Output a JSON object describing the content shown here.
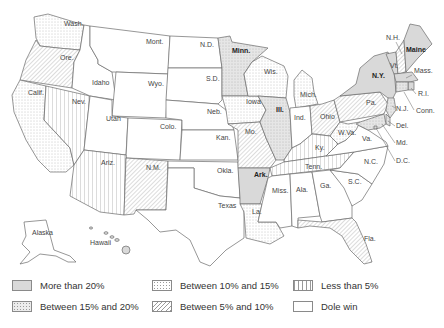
{
  "map": {
    "title": "",
    "categories": {
      "more_than_20": "More than 20%",
      "between_15_20": "Between 15% and 20%",
      "between_10_15": "Between 10% and 15%",
      "between_5_10": "Between 5% and 10%",
      "less_than_5": "Less than 5%",
      "dole_win": "Dole win"
    },
    "states": {
      "wash": {
        "label": "Wash.",
        "category": "between_10_15"
      },
      "ore": {
        "label": "Ore.",
        "category": "between_5_10"
      },
      "calif": {
        "label": "Calif.",
        "category": "between_10_15"
      },
      "nev": {
        "label": "Nev.",
        "category": "less_than_5"
      },
      "idaho": {
        "label": "Idaho",
        "category": "dole_win"
      },
      "mont": {
        "label": "Mont.",
        "category": "dole_win"
      },
      "wyo": {
        "label": "Wyo.",
        "category": "dole_win"
      },
      "utah": {
        "label": "Utah",
        "category": "dole_win"
      },
      "colo": {
        "label": "Colo.",
        "category": "dole_win"
      },
      "ariz": {
        "label": "Ariz.",
        "category": "less_than_5"
      },
      "nm": {
        "label": "N.M.",
        "category": "between_5_10"
      },
      "nd": {
        "label": "N.D.",
        "category": "dole_win"
      },
      "sd": {
        "label": "S.D.",
        "category": "dole_win"
      },
      "neb": {
        "label": "Neb.",
        "category": "dole_win"
      },
      "kan": {
        "label": "Kan.",
        "category": "dole_win"
      },
      "okla": {
        "label": "Okla.",
        "category": "dole_win"
      },
      "texas": {
        "label": "Texas",
        "category": "dole_win"
      },
      "minn": {
        "label": "Minn.",
        "category": "between_15_20"
      },
      "iowa": {
        "label": "Iowa",
        "category": "between_10_15"
      },
      "mo": {
        "label": "Mo.",
        "category": "between_5_10"
      },
      "ark": {
        "label": "Ark.",
        "category": "more_than_20"
      },
      "la": {
        "label": "La.",
        "category": "between_10_15"
      },
      "wis": {
        "label": "Wis.",
        "category": "between_10_15"
      },
      "ill": {
        "label": "Ill.",
        "category": "between_15_20"
      },
      "mich": {
        "label": "Mich.",
        "category": "between_10_15"
      },
      "ind": {
        "label": "Ind.",
        "category": "dole_win"
      },
      "ohio": {
        "label": "Ohio",
        "category": "between_5_10"
      },
      "ky": {
        "label": "Ky.",
        "category": "less_than_5"
      },
      "tenn": {
        "label": "Tenn.",
        "category": "less_than_5"
      },
      "miss": {
        "label": "Miss.",
        "category": "dole_win"
      },
      "ala": {
        "label": "Ala.",
        "category": "dole_win"
      },
      "ga": {
        "label": "Ga.",
        "category": "dole_win"
      },
      "fla": {
        "label": "Fla.",
        "category": "between_5_10"
      },
      "sc": {
        "label": "S.C.",
        "category": "dole_win"
      },
      "nc": {
        "label": "N.C.",
        "category": "dole_win"
      },
      "va": {
        "label": "Va.",
        "category": "dole_win"
      },
      "wva": {
        "label": "W.Va.",
        "category": "between_10_15"
      },
      "pa": {
        "label": "Pa.",
        "category": "between_5_10"
      },
      "ny": {
        "label": "N.Y.",
        "category": "more_than_20"
      },
      "vt": {
        "label": "Vt.",
        "category": "more_than_20"
      },
      "nh": {
        "label": "N.H.",
        "category": "between_5_10"
      },
      "maine": {
        "label": "Maine",
        "category": "more_than_20"
      },
      "mass": {
        "label": "Mass.",
        "category": "more_than_20"
      },
      "ri": {
        "label": "R.I.",
        "category": "more_than_20"
      },
      "conn": {
        "label": "Conn.",
        "category": "between_15_20"
      },
      "nj": {
        "label": "N.J.",
        "category": "between_15_20"
      },
      "del": {
        "label": "Del.",
        "category": "between_15_20"
      },
      "md": {
        "label": "Md.",
        "category": "between_15_20"
      },
      "dc": {
        "label": "D.C.",
        "category": "more_than_20"
      },
      "alaska": {
        "label": "Alaska",
        "category": "dole_win"
      },
      "hawaii": {
        "label": "Hawaii",
        "category": "more_than_20"
      }
    }
  },
  "legend": {
    "items": [
      {
        "key": "more_than_20",
        "label": "More than 20%"
      },
      {
        "key": "between_15_20",
        "label": "Between 15% and 20%"
      },
      {
        "key": "between_10_15",
        "label": "Between 10% and 15%"
      },
      {
        "key": "between_5_10",
        "label": "Between 5% and 10%"
      },
      {
        "key": "less_than_5",
        "label": "Less than 5%"
      },
      {
        "key": "dole_win",
        "label": "Dole win"
      }
    ]
  },
  "colors": {
    "more_than_20": "#d9d9d9",
    "pattern_ink": "#9a9a9a",
    "border": "#6a6a6a",
    "background": "#ffffff"
  }
}
